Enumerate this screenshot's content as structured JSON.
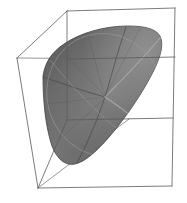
{
  "figure": {
    "title": "3D surface plot in wireframe bounding box",
    "kind": "3d-isosurface",
    "background_color": "#ffffff",
    "width": 187,
    "height": 203
  },
  "chart_data": {
    "type": "scatter",
    "title": "",
    "subtitle": "",
    "xlabel": "",
    "ylabel": "",
    "zlabel": "",
    "grid": false,
    "legend": null,
    "projection": "3d-perspective",
    "axis_ticks": [],
    "tick_labels": [],
    "annotations": [],
    "bounding_box": {
      "name": "wireframe-cube",
      "stroke_color": "#5a5a5a",
      "stroke_width": 0.7,
      "vertices_2d": {
        "front_top_left": [
          67,
          11
        ],
        "front_top_right": [
          175,
          8
        ],
        "front_bottom_right": [
          172,
          186
        ],
        "front_bottom_left": [
          67,
          179
        ],
        "back_top_left": [
          17,
          58
        ],
        "back_top_right": [
          131,
          59
        ],
        "back_bottom_right": [
          129,
          119
        ],
        "back_bottom_left": [
          38,
          188
        ]
      },
      "edges": [
        [
          "front_top_left",
          "front_top_right"
        ],
        [
          "front_top_right",
          "front_bottom_right"
        ],
        [
          "front_bottom_right",
          "back_bottom_left"
        ],
        [
          "back_bottom_left",
          "front_top_left"
        ],
        [
          "front_top_left",
          "back_top_left"
        ],
        [
          "back_top_left",
          "back_bottom_left"
        ],
        [
          "back_top_left",
          "back_top_right"
        ],
        [
          "back_bottom_left",
          "back_bottom_right"
        ]
      ]
    },
    "surface": {
      "name": "rounded-triangular-isosurface",
      "fill_color_light": "#8b8b8b",
      "fill_color_mid": "#6e6e6e",
      "fill_color_dark": "#555555",
      "outline_color": "#3c3c3c",
      "silhouette_2d": [
        [
          43,
          76
        ],
        [
          62,
          52
        ],
        [
          92,
          34
        ],
        [
          128,
          27
        ],
        [
          150,
          27
        ],
        [
          161,
          34
        ],
        [
          162,
          48
        ],
        [
          152,
          74
        ],
        [
          132,
          107
        ],
        [
          110,
          137
        ],
        [
          92,
          156
        ],
        [
          76,
          164
        ],
        [
          62,
          162
        ],
        [
          53,
          150
        ],
        [
          46,
          122
        ],
        [
          42,
          95
        ]
      ],
      "seam_curves": [
        {
          "name": "upper-fold",
          "from": [
            105,
            97
          ],
          "to": [
            126,
            28
          ]
        },
        {
          "name": "left-fold",
          "from": [
            105,
            97
          ],
          "to": [
            44,
            78
          ]
        },
        {
          "name": "lower-fold",
          "from": [
            105,
            97
          ],
          "to": [
            78,
            163
          ]
        },
        {
          "name": "right-highlight",
          "from": [
            105,
            97
          ],
          "to": [
            160,
            38
          ]
        },
        {
          "name": "lower-right-highlight",
          "from": [
            105,
            97
          ],
          "to": [
            155,
            140
          ]
        },
        {
          "name": "equator-ellipse",
          "center": [
            105,
            95
          ],
          "rx": 58,
          "ry": 62,
          "rot": -18
        }
      ],
      "focal_point_2d": [
        105,
        97
      ]
    },
    "colors": {
      "background": "#ffffff",
      "box_stroke": "#5a5a5a",
      "surface_mid": "#6e6e6e",
      "surface_highlight": "#9a9a9a",
      "surface_shadow": "#4e4e4e"
    }
  }
}
